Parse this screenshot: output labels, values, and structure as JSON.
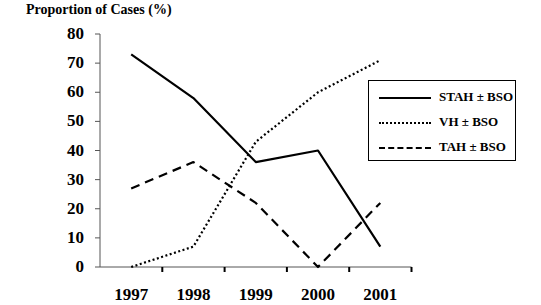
{
  "chart_data": {
    "type": "line",
    "title": "",
    "ylabel": "Proportion of Cases (%)",
    "xlabel": "",
    "categories": [
      "1997",
      "1998",
      "1999",
      "2000",
      "2001"
    ],
    "yticks": [
      "0",
      "10",
      "20",
      "30",
      "40",
      "50",
      "60",
      "70",
      "80"
    ],
    "ylim": [
      0,
      80
    ],
    "grid": false,
    "legend_position": "right, inside box",
    "series": [
      {
        "name": "STAH ± BSO",
        "style": "solid",
        "values": [
          73,
          58,
          36,
          40,
          7
        ]
      },
      {
        "name": "VH ± BSO",
        "style": "dotted",
        "values": [
          0,
          7,
          43,
          60,
          71
        ]
      },
      {
        "name": "TAH ± BSO",
        "style": "dashed",
        "values": [
          27,
          36,
          22,
          0,
          22
        ]
      }
    ]
  },
  "colors": {
    "line": "#000000",
    "axis": "#555555",
    "background": "#ffffff"
  }
}
